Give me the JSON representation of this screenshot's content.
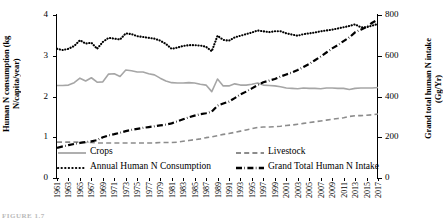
{
  "chart_data": {
    "type": "line",
    "title": "",
    "xlabel": "",
    "ylabel": "Human N consumption (kg N/capita/year)",
    "y2label": "Grand total human N intake (Gg/Yr)",
    "xlim": [
      1961,
      2017
    ],
    "ylim": [
      0,
      4
    ],
    "y2lim": [
      0,
      800
    ],
    "yticks": [
      "0",
      "1",
      "2",
      "3",
      "4"
    ],
    "y2ticks": [
      "0",
      "200",
      "400",
      "600",
      "800"
    ],
    "grid": false,
    "legend_position": "inside-bottom",
    "x": [
      1961,
      1962,
      1963,
      1964,
      1965,
      1966,
      1967,
      1968,
      1969,
      1970,
      1971,
      1972,
      1973,
      1974,
      1975,
      1976,
      1977,
      1978,
      1979,
      1980,
      1981,
      1982,
      1983,
      1984,
      1985,
      1986,
      1987,
      1988,
      1989,
      1990,
      1991,
      1992,
      1993,
      1994,
      1995,
      1996,
      1997,
      1998,
      1999,
      2000,
      2001,
      2002,
      2003,
      2004,
      2005,
      2006,
      2007,
      2008,
      2009,
      2010,
      2011,
      2012,
      2013,
      2014,
      2015,
      2016,
      2017
    ],
    "xticklabels": [
      "1961",
      "1963",
      "1965",
      "1967",
      "1969",
      "1971",
      "1973",
      "1975",
      "1977",
      "1979",
      "1981",
      "1983",
      "1985",
      "1987",
      "1989",
      "1991",
      "1993",
      "1995",
      "1997",
      "1999",
      "2001",
      "2003",
      "2005",
      "2007",
      "2009",
      "2011",
      "2013",
      "2015",
      "2017"
    ],
    "series": [
      {
        "name": "Crops",
        "axis": "left",
        "style": "solid",
        "color": "#a6a6a6",
        "values": [
          2.27,
          2.27,
          2.28,
          2.34,
          2.45,
          2.38,
          2.46,
          2.35,
          2.36,
          2.55,
          2.56,
          2.49,
          2.65,
          2.63,
          2.6,
          2.6,
          2.56,
          2.53,
          2.45,
          2.38,
          2.34,
          2.33,
          2.33,
          2.34,
          2.33,
          2.3,
          2.28,
          2.12,
          2.43,
          2.26,
          2.26,
          2.31,
          2.28,
          2.28,
          2.3,
          2.33,
          2.28,
          2.27,
          2.26,
          2.24,
          2.21,
          2.2,
          2.19,
          2.21,
          2.2,
          2.2,
          2.19,
          2.21,
          2.21,
          2.2,
          2.2,
          2.17,
          2.2,
          2.21,
          2.21,
          2.21,
          2.22
        ]
      },
      {
        "name": "Livestock",
        "axis": "left",
        "style": "dashed",
        "color": "#8c8c8c",
        "values": [
          0.88,
          0.88,
          0.88,
          0.88,
          0.88,
          0.87,
          0.87,
          0.86,
          0.86,
          0.86,
          0.86,
          0.86,
          0.86,
          0.86,
          0.86,
          0.86,
          0.86,
          0.86,
          0.87,
          0.87,
          0.87,
          0.88,
          0.9,
          0.92,
          0.94,
          0.96,
          0.99,
          1.01,
          1.04,
          1.07,
          1.09,
          1.12,
          1.15,
          1.18,
          1.21,
          1.24,
          1.25,
          1.25,
          1.26,
          1.27,
          1.29,
          1.3,
          1.32,
          1.34,
          1.36,
          1.38,
          1.4,
          1.42,
          1.44,
          1.46,
          1.48,
          1.51,
          1.53,
          1.53,
          1.54,
          1.55,
          1.57
        ]
      },
      {
        "name": "Annual Human N Consumption",
        "axis": "left",
        "style": "dotted",
        "color": "#000000",
        "values": [
          3.17,
          3.14,
          3.17,
          3.24,
          3.38,
          3.3,
          3.32,
          3.17,
          3.34,
          3.44,
          3.42,
          3.4,
          3.55,
          3.53,
          3.48,
          3.46,
          3.44,
          3.42,
          3.37,
          3.29,
          3.17,
          3.2,
          3.24,
          3.26,
          3.26,
          3.25,
          3.22,
          3.11,
          3.49,
          3.39,
          3.37,
          3.45,
          3.49,
          3.53,
          3.57,
          3.62,
          3.6,
          3.58,
          3.6,
          3.6,
          3.55,
          3.52,
          3.49,
          3.53,
          3.55,
          3.57,
          3.6,
          3.62,
          3.64,
          3.67,
          3.7,
          3.73,
          3.77,
          3.7,
          3.7,
          3.74,
          3.78
        ]
      },
      {
        "name": "Grand Total Human N Intake",
        "axis": "right",
        "style": "dashdot",
        "color": "#000000",
        "values": [
          148,
          155,
          161,
          167,
          172,
          176,
          180,
          186,
          200,
          209,
          215,
          222,
          230,
          236,
          241,
          246,
          250,
          254,
          258,
          262,
          268,
          278,
          288,
          298,
          306,
          313,
          318,
          326,
          355,
          366,
          375,
          392,
          410,
          424,
          440,
          456,
          470,
          478,
          486,
          498,
          508,
          518,
          530,
          545,
          560,
          578,
          596,
          616,
          636,
          652,
          672,
          690,
          715,
          728,
          742,
          762,
          778
        ]
      }
    ]
  },
  "axes": {
    "left_title": "Human N consumption (kg\nN/capita/year)",
    "right_title": "Grand total human N intake\n(Gg/Yr)"
  },
  "legend": {
    "items": [
      {
        "label": "Crops",
        "style": "solid",
        "color": "#a6a6a6"
      },
      {
        "label": "Livestock",
        "style": "dashed",
        "color": "#8c8c8c"
      },
      {
        "label": "Annual Human N Consumption",
        "style": "dotted",
        "color": "#000000"
      },
      {
        "label": "Grand Total Human N Intake",
        "style": "dashdot",
        "color": "#000000"
      }
    ]
  },
  "caption": {
    "text": "FIGURE 1.7"
  }
}
